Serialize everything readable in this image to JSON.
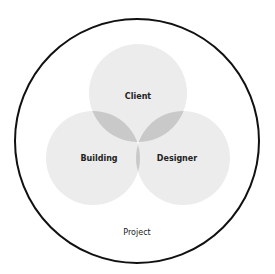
{
  "diagram": {
    "outer": {
      "label": "Project"
    },
    "circles": [
      {
        "id": "client",
        "label": "Client"
      },
      {
        "id": "building",
        "label": "Building"
      },
      {
        "id": "designer",
        "label": "Designer"
      }
    ],
    "colors": {
      "single": "#ececec",
      "pair": "#c9c9c9",
      "triple": "#a9a9a9",
      "outline": "#111111"
    }
  }
}
